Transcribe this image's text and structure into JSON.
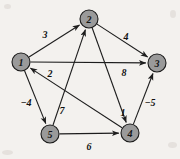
{
  "figure": {
    "type": "directed-weighted-graph",
    "background_color": "#f3f1ee",
    "node_fill_color": "#9a9a9a",
    "node_stroke_color": "#1a1a1a",
    "edge_color": "#1d1d1d",
    "node_radius": 9
  },
  "nodes": [
    {
      "id": "1",
      "label": "1",
      "x": 21,
      "y": 62
    },
    {
      "id": "2",
      "label": "2",
      "x": 89,
      "y": 19
    },
    {
      "id": "3",
      "label": "3",
      "x": 157,
      "y": 63
    },
    {
      "id": "4",
      "label": "4",
      "x": 130,
      "y": 133
    },
    {
      "id": "5",
      "label": "5",
      "x": 50,
      "y": 134
    }
  ],
  "edges": [
    {
      "from": "1",
      "to": "2",
      "weight": "3",
      "label_x": 45,
      "label_y": 34
    },
    {
      "from": "2",
      "to": "3",
      "weight": "4",
      "label_x": 126,
      "label_y": 36
    },
    {
      "from": "1",
      "to": "3",
      "weight": "8",
      "label_x": 124,
      "label_y": 72
    },
    {
      "from": "4",
      "to": "1",
      "weight": "2",
      "label_x": 50,
      "label_y": 73
    },
    {
      "from": "1",
      "to": "5",
      "weight": "−4",
      "label_x": 26,
      "label_y": 102
    },
    {
      "from": "5",
      "to": "2",
      "weight": "7",
      "label_x": 62,
      "label_y": 110
    },
    {
      "from": "2",
      "to": "4",
      "weight": "1",
      "label_x": 123,
      "label_y": 112
    },
    {
      "from": "4",
      "to": "3",
      "weight": "−5",
      "label_x": 150,
      "label_y": 102
    },
    {
      "from": "5",
      "to": "4",
      "weight": "6",
      "label_x": 89,
      "label_y": 146
    }
  ]
}
